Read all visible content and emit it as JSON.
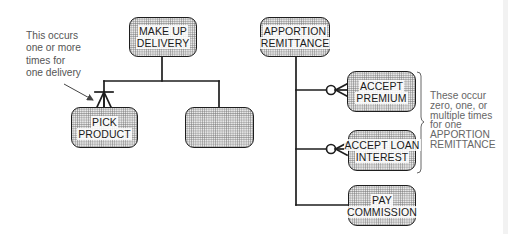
{
  "diagram": {
    "left_tree": {
      "root": {
        "lines": [
          "MAKE UP",
          "DELIVERY"
        ]
      },
      "children": [
        {
          "lines": [
            "PICK",
            "PRODUCT"
          ],
          "cardinality": "one-or-more"
        },
        {
          "lines": [],
          "cardinality": "one"
        }
      ],
      "annotation": {
        "lines": [
          "This occurs",
          "one or more",
          "times for",
          "one delivery"
        ]
      }
    },
    "right_tree": {
      "root": {
        "lines": [
          "APPORTION",
          "REMITTANCE"
        ]
      },
      "children": [
        {
          "lines": [
            "ACCEPT",
            "PREMIUM"
          ],
          "cardinality": "zero-one-or-many"
        },
        {
          "lines": [
            "ACCEPT LOAN",
            "INTEREST"
          ],
          "cardinality": "zero-one-or-many"
        },
        {
          "lines": [
            "PAY",
            "COMMISSION"
          ],
          "cardinality": "one"
        }
      ],
      "annotation": {
        "lines": [
          "These occur",
          "zero, one, or",
          "multiple times",
          "for one",
          "APPORTION",
          "REMITTANCE"
        ]
      }
    },
    "colors": {
      "line": "#1e1e1e",
      "node_fill": "#e9e9e9",
      "stipple": "#8a8a8a",
      "annotation_text": "#555555"
    }
  }
}
